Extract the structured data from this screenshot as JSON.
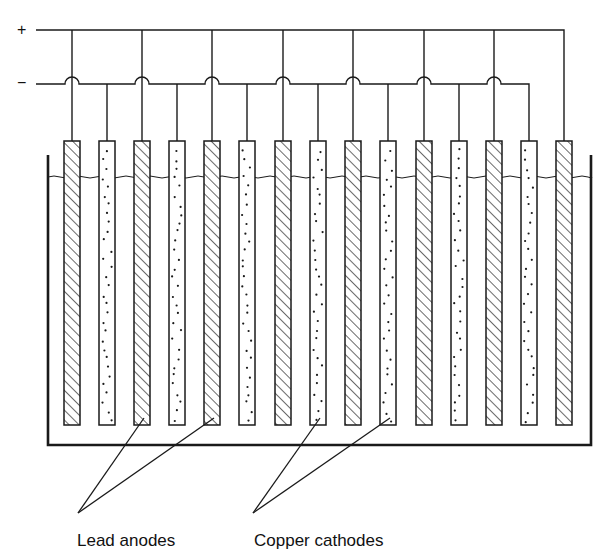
{
  "diagram": {
    "title": "",
    "type": "electrolytic-cell-electrode-arrangement",
    "terminals": {
      "positive": {
        "symbol": "+",
        "y": 30
      },
      "negative": {
        "symbol": "−",
        "y": 84
      }
    },
    "tank": {
      "left": 48,
      "right": 591,
      "top": 155,
      "bottom": 445,
      "electrolyte_level": 177
    },
    "electrode_geometry": {
      "top": 141,
      "bottom": 425,
      "width": 16
    },
    "electrodes": [
      {
        "x": 64,
        "kind": "anode"
      },
      {
        "x": 99,
        "kind": "cathode"
      },
      {
        "x": 134,
        "kind": "anode"
      },
      {
        "x": 169,
        "kind": "cathode"
      },
      {
        "x": 204,
        "kind": "anode"
      },
      {
        "x": 239,
        "kind": "cathode"
      },
      {
        "x": 275,
        "kind": "anode"
      },
      {
        "x": 310,
        "kind": "cathode"
      },
      {
        "x": 345,
        "kind": "anode"
      },
      {
        "x": 380,
        "kind": "cathode"
      },
      {
        "x": 416,
        "kind": "anode"
      },
      {
        "x": 451,
        "kind": "cathode"
      },
      {
        "x": 486,
        "kind": "anode"
      },
      {
        "x": 521,
        "kind": "cathode"
      },
      {
        "x": 556,
        "kind": "anode"
      }
    ],
    "legend": [
      {
        "label": "Lead anodes",
        "pattern": "hatched",
        "target_electrodes": [
          2,
          4
        ],
        "apex": [
          78,
          513
        ],
        "text_x": 77,
        "text_y": 531
      },
      {
        "label": "Copper cathodes",
        "pattern": "dotted",
        "target_electrodes": [
          7,
          9
        ],
        "apex": [
          253,
          513
        ],
        "text_x": 254,
        "text_y": 531
      }
    ],
    "colors": {
      "ink": "#1a1a1a",
      "background": "#ffffff"
    }
  }
}
